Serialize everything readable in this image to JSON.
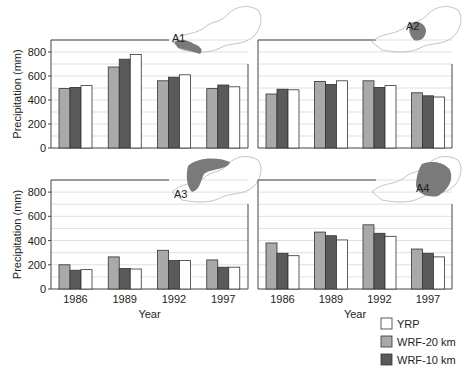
{
  "colors": {
    "yrp": "#ffffff",
    "wrf20": "#a9a9a9",
    "wrf10": "#5a5a5a",
    "bar_stroke": "#333333",
    "grid": "#d8d8d8",
    "axis": "#444444",
    "map_region": "#7a7a7a",
    "map_outline": "#c4c4c4"
  },
  "legend": {
    "items": [
      {
        "key": "yrp",
        "label": "YRP"
      },
      {
        "key": "wrf20",
        "label": "WRF-20 km"
      },
      {
        "key": "wrf10",
        "label": "WRF-10 km"
      }
    ]
  },
  "chart_data": [
    {
      "type": "bar",
      "panel": "A1",
      "title": "A1",
      "categories": [
        "1986",
        "1989",
        "1992",
        "1997"
      ],
      "series": [
        {
          "name": "WRF-20 km",
          "values": [
            495,
            675,
            560,
            495
          ]
        },
        {
          "name": "WRF-10 km",
          "values": [
            505,
            740,
            590,
            525
          ]
        },
        {
          "name": "YRP",
          "values": [
            520,
            780,
            610,
            510
          ]
        }
      ],
      "xlabel": "",
      "ylabel": "Precipitation (mm)",
      "ylim": [
        0,
        900
      ],
      "yticks": [
        0,
        200,
        400,
        600,
        800
      ],
      "grid": true
    },
    {
      "type": "bar",
      "panel": "A2",
      "title": "A2",
      "categories": [
        "1986",
        "1989",
        "1992",
        "1997"
      ],
      "series": [
        {
          "name": "WRF-20 km",
          "values": [
            450,
            555,
            560,
            460
          ]
        },
        {
          "name": "WRF-10 km",
          "values": [
            490,
            530,
            505,
            435
          ]
        },
        {
          "name": "YRP",
          "values": [
            485,
            560,
            520,
            425
          ]
        }
      ],
      "xlabel": "",
      "ylabel": "",
      "ylim": [
        0,
        900
      ],
      "yticks": [
        0,
        200,
        400,
        600,
        800
      ],
      "grid": true
    },
    {
      "type": "bar",
      "panel": "A3",
      "title": "A3",
      "categories": [
        "1986",
        "1989",
        "1992",
        "1997"
      ],
      "series": [
        {
          "name": "WRF-20 km",
          "values": [
            200,
            265,
            320,
            240
          ]
        },
        {
          "name": "WRF-10 km",
          "values": [
            155,
            170,
            235,
            180
          ]
        },
        {
          "name": "YRP",
          "values": [
            160,
            165,
            235,
            180
          ]
        }
      ],
      "xlabel": "Year",
      "ylabel": "Precipitation (mm)",
      "ylim": [
        0,
        900
      ],
      "yticks": [
        0,
        200,
        400,
        600,
        800
      ],
      "grid": true
    },
    {
      "type": "bar",
      "panel": "A4",
      "title": "A4",
      "categories": [
        "1986",
        "1989",
        "1992",
        "1997"
      ],
      "series": [
        {
          "name": "WRF-20 km",
          "values": [
            380,
            470,
            530,
            330
          ]
        },
        {
          "name": "WRF-10 km",
          "values": [
            295,
            440,
            460,
            295
          ]
        },
        {
          "name": "YRP",
          "values": [
            275,
            405,
            435,
            265
          ]
        }
      ],
      "xlabel": "Year",
      "ylabel": "",
      "ylim": [
        0,
        900
      ],
      "yticks": [
        0,
        200,
        400,
        600,
        800
      ],
      "grid": true
    }
  ]
}
